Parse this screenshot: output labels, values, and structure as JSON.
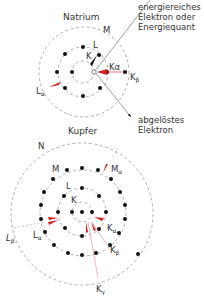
{
  "natrium": {
    "title": "Natrium",
    "shells": {
      "K": "K",
      "L": "L",
      "M": "M"
    },
    "transitions": {
      "ka": "Kα",
      "kb_main": "K",
      "kb_sub": "β",
      "la_main": "L",
      "la_sub": "α"
    },
    "incoming_label": [
      "energiereiches",
      "Elektron oder",
      "Energiequant"
    ],
    "outgoing_label": [
      "abgelöstes",
      "Elektron"
    ]
  },
  "kupfer": {
    "title": "Kupfer",
    "shells": {
      "K": "K",
      "L": "L",
      "M": "M",
      "N": "N"
    },
    "transitions": {
      "ma_main": "M",
      "ma_sub": "α",
      "ka_main": "K",
      "ka_sub": "α",
      "kb_main": "K",
      "kb_sub": "β",
      "kg_main": "K",
      "kg_sub": "γ",
      "la_main": "L",
      "la_sub": "α",
      "lb_main": "L",
      "lb_sub": "β"
    }
  },
  "colors": {
    "arrow": "#d42020",
    "shell": "#999999",
    "electron": "#111111",
    "line": "#888888"
  }
}
